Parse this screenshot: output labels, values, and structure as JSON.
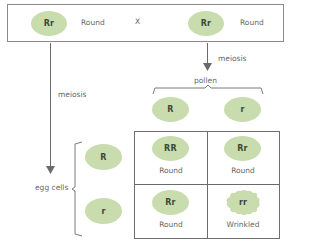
{
  "parents": {
    "left": {
      "genotype": "Rr",
      "phenotype": "Round"
    },
    "cross_symbol": "X",
    "right": {
      "genotype": "Rr",
      "phenotype": "Round"
    }
  },
  "arrows": {
    "left_label": "meiosis",
    "right_label": "meiosis"
  },
  "pollen": {
    "label": "pollen",
    "gametes": [
      "R",
      "r"
    ]
  },
  "egg_cells": {
    "label": "egg cells",
    "gametes": [
      "R",
      "r"
    ]
  },
  "punnett": {
    "cells": [
      {
        "genotype": "RR",
        "phenotype": "Round"
      },
      {
        "genotype": "Rr",
        "phenotype": "Round"
      },
      {
        "genotype": "Rr",
        "phenotype": "Round"
      },
      {
        "genotype": "rr",
        "phenotype": "Wrinkled"
      }
    ]
  },
  "colors": {
    "pea_fill": "#c9dcae",
    "line": "#6a6a6a",
    "text": "#666666"
  }
}
